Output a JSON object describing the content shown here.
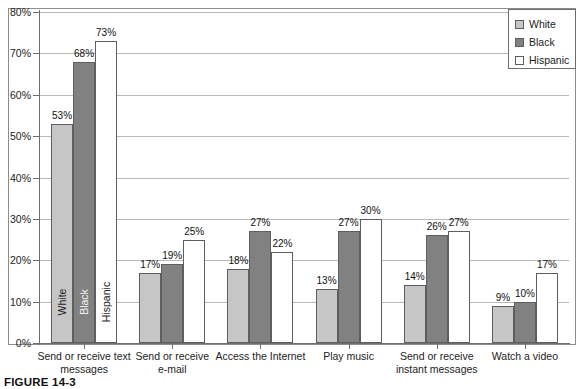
{
  "caption": "FIGURE 14-3",
  "legend": {
    "position": "top-right",
    "items": [
      {
        "label": "White",
        "color": "#c6c6c6",
        "icon": "legend-swatch-white"
      },
      {
        "label": "Black",
        "color": "#818181",
        "icon": "legend-swatch-black"
      },
      {
        "label": "Hispanic",
        "color": "#ffffff",
        "icon": "legend-swatch-hispanic"
      }
    ]
  },
  "chart_data": {
    "type": "bar",
    "title": "",
    "xlabel": "",
    "ylabel": "",
    "ylim": [
      0,
      80
    ],
    "ytick_labels": [
      "0%",
      "10%",
      "20%",
      "30%",
      "40%",
      "50%",
      "60%",
      "70%",
      "80%"
    ],
    "ytick_values": [
      0,
      10,
      20,
      30,
      40,
      50,
      60,
      70,
      80
    ],
    "grid": true,
    "legend_position": "top-right",
    "value_suffix": "%",
    "categories": [
      "Send or receive text messages",
      "Send or receive e-mail",
      "Access the Internet",
      "Play music",
      "Send or receive instant messages",
      "Watch a video"
    ],
    "category_lines": [
      [
        "Send or receive text",
        "messages"
      ],
      [
        "Send or receive",
        "e-mail"
      ],
      [
        "Access the Internet"
      ],
      [
        "Play music"
      ],
      [
        "Send or receive",
        "instant messages"
      ],
      [
        "Watch a video"
      ]
    ],
    "series": [
      {
        "name": "White",
        "color": "#c6c6c6",
        "values": [
          53,
          17,
          18,
          13,
          14,
          9
        ]
      },
      {
        "name": "Black",
        "color": "#818181",
        "values": [
          68,
          19,
          27,
          27,
          26,
          10
        ]
      },
      {
        "name": "Hispanic",
        "color": "#ffffff",
        "values": [
          73,
          25,
          22,
          30,
          27,
          17
        ]
      }
    ],
    "value_labels": [
      [
        "53%",
        "68%",
        "73%"
      ],
      [
        "17%",
        "19%",
        "25%"
      ],
      [
        "18%",
        "27%",
        "22%"
      ],
      [
        "13%",
        "27%",
        "30%"
      ],
      [
        "14%",
        "26%",
        "27%"
      ],
      [
        "9%",
        "10%",
        "17%"
      ]
    ],
    "in_bar_labels": [
      "White",
      "Black",
      "Hispanic"
    ],
    "in_bar_group_index": 0
  }
}
